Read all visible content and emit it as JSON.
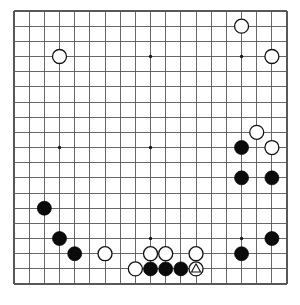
{
  "diagram": {
    "kind": "go-board-diagram",
    "board_size": 19,
    "board_pixel_left": 14,
    "board_pixel_top": 11,
    "cell_spacing": 15.17,
    "stone_radius": 7.0,
    "background_color": "#ffffff",
    "line_color": "#585858",
    "black_color": "#0b0b0b",
    "white_color": "#ffffff",
    "mark_color": "#111111",
    "star_points": [
      {
        "col": 3,
        "row": 3
      },
      {
        "col": 9,
        "row": 3
      },
      {
        "col": 15,
        "row": 3
      },
      {
        "col": 3,
        "row": 9
      },
      {
        "col": 9,
        "row": 9
      },
      {
        "col": 15,
        "row": 9
      },
      {
        "col": 3,
        "row": 15
      },
      {
        "col": 9,
        "row": 15
      },
      {
        "col": 15,
        "row": 15
      }
    ],
    "stones": [
      {
        "id": "w-d16",
        "color": "white",
        "col": 3,
        "row": 3,
        "label": ""
      },
      {
        "id": "w-p18",
        "color": "white",
        "col": 15,
        "row": 1,
        "label": ""
      },
      {
        "id": "w-r16",
        "color": "white",
        "col": 17,
        "row": 3,
        "label": ""
      },
      {
        "id": "w-r11",
        "color": "white",
        "col": 16,
        "row": 8,
        "label": ""
      },
      {
        "id": "b-p10",
        "color": "black",
        "col": 15,
        "row": 9,
        "label": ""
      },
      {
        "id": "w-r10",
        "color": "white",
        "col": 17,
        "row": 9,
        "label": ""
      },
      {
        "id": "b-p8",
        "color": "black",
        "col": 15,
        "row": 11,
        "label": ""
      },
      {
        "id": "b-r8",
        "color": "black",
        "col": 17,
        "row": 11,
        "label": ""
      },
      {
        "id": "b-d6",
        "color": "black",
        "col": 2,
        "row": 13,
        "label": ""
      },
      {
        "id": "b-e4",
        "color": "black",
        "col": 3,
        "row": 15,
        "label": ""
      },
      {
        "id": "b-f3",
        "color": "black",
        "col": 4,
        "row": 16,
        "label": ""
      },
      {
        "id": "w-h3",
        "color": "white",
        "col": 6,
        "row": 16,
        "label": ""
      },
      {
        "id": "b-r4",
        "color": "black",
        "col": 17,
        "row": 15,
        "label": ""
      },
      {
        "id": "b-p3",
        "color": "black",
        "col": 15,
        "row": 16,
        "label": ""
      },
      {
        "id": "w-k3",
        "color": "white",
        "col": 9,
        "row": 16,
        "label": ""
      },
      {
        "id": "w-l3",
        "color": "white",
        "col": 10,
        "row": 16,
        "label": ""
      },
      {
        "id": "w-n3",
        "color": "white",
        "col": 12,
        "row": 16,
        "label": ""
      },
      {
        "id": "w-j2",
        "color": "white",
        "col": 8,
        "row": 17,
        "label": ""
      },
      {
        "id": "b-k2",
        "color": "black",
        "col": 9,
        "row": 17,
        "label": ""
      },
      {
        "id": "b-l2",
        "color": "black",
        "col": 10,
        "row": 17,
        "label": ""
      },
      {
        "id": "b-m2",
        "color": "black",
        "col": 11,
        "row": 17,
        "label": ""
      },
      {
        "id": "w-n2",
        "color": "white",
        "col": 12,
        "row": 17,
        "label": ""
      }
    ],
    "marks": [
      {
        "id": "triangle-n2",
        "shape": "triangle",
        "col": 12,
        "row": 17,
        "on_color": "white"
      }
    ],
    "counts": {
      "black_stones": 10,
      "white_stones": 12,
      "total_stones": 22,
      "marked_stones": 1
    }
  }
}
